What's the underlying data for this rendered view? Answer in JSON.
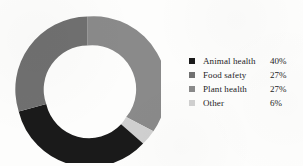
{
  "chart_data": {
    "type": "pie",
    "variant": "donut",
    "title": "",
    "xlabel": "",
    "ylabel": "",
    "categories": [
      "Animal health",
      "Food safety",
      "Plant health",
      "Other"
    ],
    "values": [
      40,
      27,
      27,
      6
    ],
    "value_labels": [
      "40%",
      "27%",
      "27%",
      "6%"
    ],
    "unit": "%",
    "total": 100,
    "colors": [
      "#1a1a1a",
      "#707070",
      "#8a8a8a",
      "#d0d0d0"
    ],
    "legend_position": "right",
    "grid": false,
    "start_angle_deg": 0,
    "direction": "clockwise",
    "slice_order_clockwise_from_top": [
      "Plant health",
      "Other",
      "Animal health",
      "Food safety"
    ],
    "inner_radius_ratio": 0.6
  },
  "legend": {
    "rows": [
      {
        "label": "Animal health",
        "value": "40%",
        "color": "#1a1a1a",
        "swatch": "square-swatch"
      },
      {
        "label": "Food safety",
        "value": "27%",
        "color": "#707070",
        "swatch": "square-swatch"
      },
      {
        "label": "Plant health",
        "value": "27%",
        "color": "#8a8a8a",
        "swatch": "square-swatch"
      },
      {
        "label": "Other",
        "value": "6%",
        "color": "#d0d0d0",
        "swatch": "square-swatch"
      }
    ]
  },
  "donut": {
    "segments": [
      {
        "name": "Plant health",
        "value": "27%",
        "color": "#8a8a8a",
        "path": "M 73.5 0.5 A 73 73 0 0 1 139.4 115.3 L 112.2 101.1 A 44 44 0 0 0 73.5 29.5 Z"
      },
      {
        "name": "Other",
        "value": "6%",
        "color": "#d0d0d0",
        "path": "M 139.4 115.3 A 73 73 0 0 1 129.1 127.6 L 107.1 108.3 A 44 44 0 0 0 112.2 101.1 Z"
      },
      {
        "name": "Animal health",
        "value": "40%",
        "color": "#1a1a1a",
        "path": "M 129.1 127.6 A 73 73 0 0 1 4.7 95.5 L 32.2 88.1 A 44 44 0 0 0 107.1 108.3 Z"
      },
      {
        "name": "Food safety",
        "value": "27%",
        "color": "#707070",
        "path": "M 4.7 95.5 A 73 73 0 0 1 73.5 0.5 L 73.5 29.5 A 44 44 0 0 0 32.2 88.1 Z"
      }
    ]
  }
}
